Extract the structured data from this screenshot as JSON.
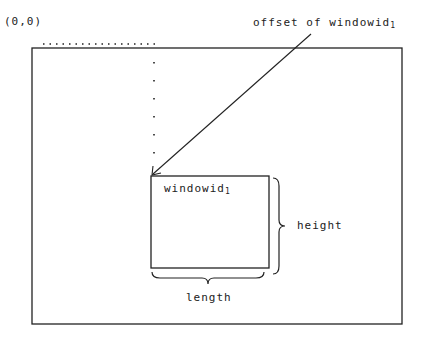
{
  "diagram": {
    "origin_label": "(0,0)",
    "offset_label": "offset of windowid",
    "offset_label_subscript": "1",
    "window_label": "windowid",
    "window_label_subscript": "1",
    "height_label": "height",
    "length_label": "length"
  },
  "colors": {
    "line": "#222222",
    "background": "#ffffff"
  }
}
